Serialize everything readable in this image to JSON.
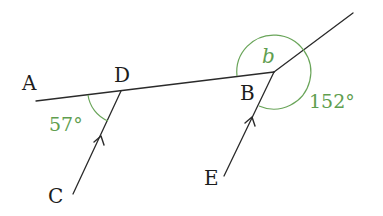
{
  "diagram": {
    "type": "geometry-parallel-lines-angles",
    "colors": {
      "line": "#2a2a2a",
      "angle_mark": "#6aa55a",
      "angle_text": "#5f9e4f",
      "point_text": "#1c1c1c"
    },
    "points": {
      "A": {
        "label": "A"
      },
      "D": {
        "label": "D"
      },
      "B": {
        "label": "B"
      },
      "C": {
        "label": "C"
      },
      "E": {
        "label": "E"
      }
    },
    "segments": [
      {
        "name": "A-D-B line",
        "from": "A",
        "to": "B",
        "through": "D"
      },
      {
        "name": "C-D",
        "from": "C",
        "to": "D",
        "parallel_arrow": true
      },
      {
        "name": "E-B",
        "from": "E",
        "to": "B",
        "parallel_arrow": true
      },
      {
        "name": "B-extension",
        "from": "B",
        "to": "upper-right"
      }
    ],
    "angles": {
      "angle_ADC": {
        "label": "57°",
        "value": 57,
        "vertex": "D"
      },
      "angle_b": {
        "label": "b",
        "vertex": "B",
        "unknown": true
      },
      "angle_152": {
        "label": "152°",
        "value": 152,
        "vertex": "B"
      }
    }
  }
}
